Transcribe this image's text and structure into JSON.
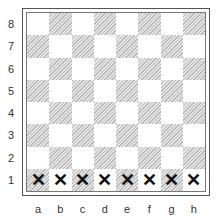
{
  "board": {
    "ranks": [
      "8",
      "7",
      "6",
      "5",
      "4",
      "3",
      "2",
      "1"
    ],
    "files": [
      "a",
      "b",
      "c",
      "d",
      "e",
      "f",
      "g",
      "h"
    ],
    "marks": {
      "1": [
        "✕",
        "✕",
        "✕",
        "✕",
        "✕",
        "✕",
        "✕",
        "✕"
      ]
    },
    "colors": {
      "light": "#ffffff",
      "dark_hatch": "#b8b8b8",
      "mark": "#111111"
    }
  }
}
